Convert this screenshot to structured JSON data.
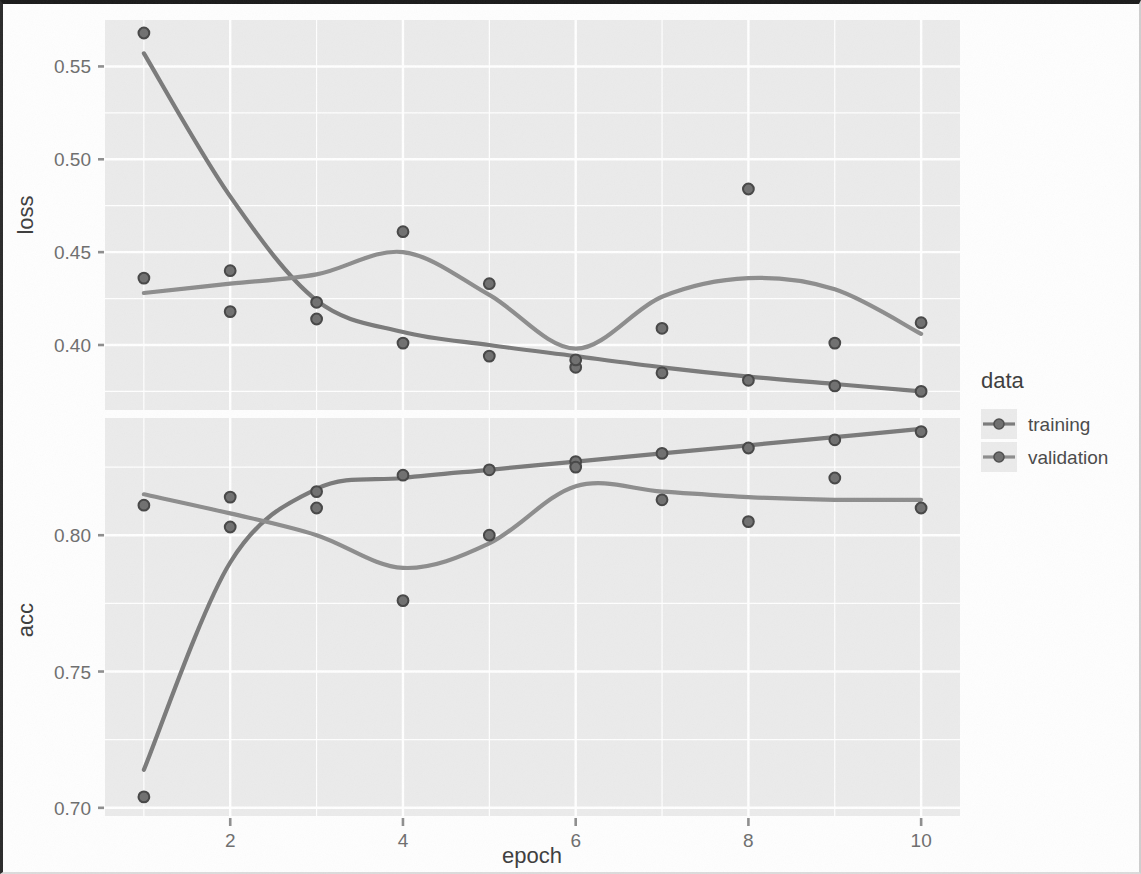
{
  "chart_data": {
    "type": "scatter",
    "title": "",
    "subtitle": "",
    "xlabel": "epoch",
    "ylabel": "",
    "facets": [
      {
        "name": "loss",
        "ylabel": "loss",
        "ylim": [
          0.365,
          0.575
        ],
        "yticks": [
          0.4,
          0.45,
          0.5,
          0.55
        ],
        "yticklabels": [
          "0.40",
          "0.45",
          "0.50",
          "0.55"
        ],
        "series": [
          {
            "name": "training",
            "color": "#7a7a7a",
            "x": [
              1,
              2,
              3,
              4,
              5,
              6,
              7,
              8,
              9,
              10
            ],
            "values": [
              0.568,
              0.44,
              0.414,
              0.401,
              0.394,
              0.388,
              0.385,
              0.381,
              0.378,
              0.375
            ],
            "smooth": [
              0.557,
              0.48,
              0.424,
              0.407,
              0.4,
              0.394,
              0.388,
              0.383,
              0.379,
              0.375
            ]
          },
          {
            "name": "validation",
            "color": "#8d8d8d",
            "x": [
              1,
              2,
              3,
              4,
              5,
              6,
              7,
              8,
              9,
              10
            ],
            "values": [
              0.436,
              0.418,
              0.423,
              0.461,
              0.433,
              0.392,
              0.409,
              0.484,
              0.401,
              0.412
            ],
            "smooth": [
              0.428,
              0.433,
              0.438,
              0.45,
              0.427,
              0.398,
              0.426,
              0.436,
              0.43,
              0.406
            ]
          }
        ]
      },
      {
        "name": "acc",
        "ylabel": "acc",
        "ylim": [
          0.697,
          0.843
        ],
        "yticks": [
          0.7,
          0.75,
          0.8
        ],
        "yticklabels": [
          "0.70",
          "0.75",
          "0.80"
        ],
        "series": [
          {
            "name": "training",
            "color": "#7a7a7a",
            "x": [
              1,
              2,
              3,
              4,
              5,
              6,
              7,
              8,
              9,
              10
            ],
            "values": [
              0.704,
              0.803,
              0.816,
              0.822,
              0.824,
              0.827,
              0.83,
              0.832,
              0.835,
              0.838
            ],
            "smooth": [
              0.714,
              0.79,
              0.817,
              0.821,
              0.824,
              0.827,
              0.83,
              0.833,
              0.836,
              0.839
            ]
          },
          {
            "name": "validation",
            "color": "#8d8d8d",
            "x": [
              1,
              2,
              3,
              4,
              5,
              6,
              7,
              8,
              9,
              10
            ],
            "values": [
              0.811,
              0.814,
              0.81,
              0.776,
              0.8,
              0.825,
              0.813,
              0.805,
              0.821,
              0.81
            ],
            "smooth": [
              0.815,
              0.808,
              0.8,
              0.788,
              0.797,
              0.818,
              0.816,
              0.814,
              0.813,
              0.813
            ]
          }
        ]
      }
    ],
    "xticks": [
      2,
      4,
      6,
      8,
      10
    ],
    "xticklabels": [
      "2",
      "4",
      "6",
      "8",
      "10"
    ],
    "xlim": [
      0.55,
      10.45
    ],
    "grid": true,
    "legend": {
      "position": "right",
      "title": "data",
      "entries": [
        {
          "label": "training",
          "color": "#7a7a7a"
        },
        {
          "label": "validation",
          "color": "#8d8d8d"
        }
      ]
    },
    "panel_background": "#ebebeb",
    "grid_color": "#ffffff"
  },
  "legend": {
    "title": "data",
    "item0": "training",
    "item1": "validation"
  },
  "axes": {
    "xlabel": "epoch",
    "ylabel_top": "loss",
    "ylabel_bottom": "acc"
  }
}
